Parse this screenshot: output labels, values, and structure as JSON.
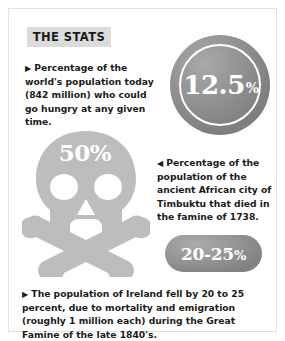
{
  "header": {
    "label": "THE STATS"
  },
  "stats": {
    "hunger": {
      "bullet": "▶",
      "value": "12.5",
      "percent_sign": "%",
      "text": "Percentage of the world's population today (842 million) who could go hungry at any given time."
    },
    "timbuktu": {
      "bullet": "◀",
      "value": "50",
      "percent_sign": "%",
      "text": "Percentage of the population of the ancient African city of Timbuktu that died in the famine of 1738."
    },
    "ireland": {
      "bullet": "▶",
      "value": "20-25",
      "percent_sign": "%",
      "text": "The population of Ireland fell by 20 to 25 percent, due to mortality and emigration (roughly 1 million each) during the Great Famine of the late 1840's."
    }
  },
  "graphics": {
    "skull_icon": "skull-and-crossbones-icon",
    "circle_icon": "circle-badge",
    "pill_icon": "pill-badge"
  },
  "colors": {
    "band_background": "#dcdcdc",
    "text": "#1b1b1b",
    "badge_gray": "#8e8e8e",
    "skull_gray": "#bdbdbd",
    "frame": "#e2e2e2"
  }
}
